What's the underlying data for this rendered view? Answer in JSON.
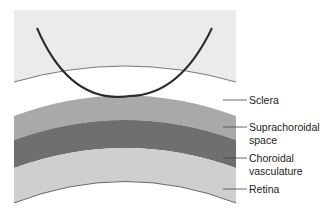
{
  "diagram": {
    "labels": {
      "sclera": "Sclera",
      "suprachoroidal_1": "Suprachoroidal",
      "suprachoroidal_2": "space",
      "choroidal_1": "Choroidal",
      "choroidal_2": "vasculature",
      "retina": "Retina"
    },
    "colors": {
      "sclera_fill": "#ebebeb",
      "suprachoroidal_fill": "#a9a9a9",
      "choroidal_fill": "#6f6f6f",
      "retina_fill": "#cfcfcf",
      "needle": "#2a2a2a"
    }
  }
}
